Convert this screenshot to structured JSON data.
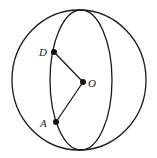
{
  "diagram": {
    "type": "sphere-geometry",
    "outer_circle": {
      "cx": 79,
      "cy": 80,
      "rx": 67,
      "ry": 70
    },
    "great_circle_ellipse": {
      "cx": 81,
      "cy": 80,
      "rx": 31,
      "ry": 70
    },
    "stroke_color": "#1a1a1a",
    "points": [
      {
        "id": "D",
        "label": "D",
        "x": 54,
        "y": 52
      },
      {
        "id": "O",
        "label": "O",
        "x": 83,
        "y": 82
      },
      {
        "id": "A",
        "label": "A",
        "x": 56,
        "y": 122
      }
    ],
    "segments": [
      {
        "from": "D",
        "to": "O"
      },
      {
        "from": "O",
        "to": "A"
      }
    ]
  }
}
